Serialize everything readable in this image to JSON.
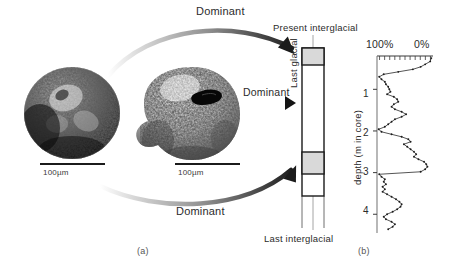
{
  "figure": {
    "panel_a_caption": "(a)",
    "panel_b_caption": "(b)"
  },
  "panel_a": {
    "specimens": [
      {
        "name": "dark-coiled-foraminifera",
        "scale_bar_label": "100µm"
      },
      {
        "name": "pale-lobed-foraminifera",
        "scale_bar_label": "100µm"
      }
    ],
    "arrows": [
      {
        "id": "arrow-top",
        "label": "Dominant"
      },
      {
        "id": "arrow-middle",
        "label": "Dominant"
      },
      {
        "id": "arrow-bottom",
        "label": "Dominant"
      }
    ],
    "core_column": {
      "top_band_label": "Present interglacial",
      "middle_label": "Last glacial",
      "bottom_band_label": "Last interglacial",
      "band_color": "#d9d9d9",
      "outline_color": "#1a1a1a"
    }
  },
  "panel_b": {
    "axis_top_left_label": "100%",
    "axis_top_right_label": "0%",
    "y_axis_label": "depth (m in core)",
    "y_ticks": [
      "1",
      "2",
      "3",
      "4"
    ]
  },
  "chart_data": {
    "type": "line",
    "title": "",
    "xlabel": "",
    "ylabel": "depth (m in core)",
    "xlim": [
      100,
      0
    ],
    "ylim": [
      0.2,
      4.45
    ],
    "x_tick_labels": [
      "100%",
      "0%"
    ],
    "y_tick_labels": [
      "1",
      "2",
      "3",
      "4"
    ],
    "grid": false,
    "legend": null,
    "x_axis_position": "top",
    "y_axis_direction": "down",
    "x_minor_tick_count": 11,
    "series": [
      {
        "name": "abundance of dominant species (%)",
        "points": [
          [
            3,
            0.25
          ],
          [
            5,
            0.33
          ],
          [
            14,
            0.4
          ],
          [
            22,
            0.46
          ],
          [
            36,
            0.52
          ],
          [
            62,
            0.58
          ],
          [
            88,
            0.64
          ],
          [
            96,
            0.7
          ],
          [
            92,
            0.76
          ],
          [
            86,
            0.82
          ],
          [
            84,
            0.88
          ],
          [
            80,
            0.94
          ],
          [
            78,
            1.0
          ],
          [
            76,
            1.06
          ],
          [
            82,
            1.12
          ],
          [
            70,
            1.18
          ],
          [
            64,
            1.24
          ],
          [
            62,
            1.3
          ],
          [
            70,
            1.36
          ],
          [
            74,
            1.42
          ],
          [
            68,
            1.48
          ],
          [
            56,
            1.54
          ],
          [
            48,
            1.6
          ],
          [
            56,
            1.66
          ],
          [
            68,
            1.72
          ],
          [
            74,
            1.78
          ],
          [
            80,
            1.84
          ],
          [
            86,
            1.9
          ],
          [
            97,
            1.96
          ],
          [
            92,
            2.02
          ],
          [
            74,
            2.08
          ],
          [
            56,
            2.14
          ],
          [
            44,
            2.2
          ],
          [
            40,
            2.26
          ],
          [
            52,
            2.32
          ],
          [
            46,
            2.38
          ],
          [
            40,
            2.44
          ],
          [
            34,
            2.5
          ],
          [
            30,
            2.56
          ],
          [
            34,
            2.62
          ],
          [
            26,
            2.68
          ],
          [
            16,
            2.74
          ],
          [
            12,
            2.8
          ],
          [
            10,
            2.86
          ],
          [
            14,
            2.92
          ],
          [
            22,
            2.98
          ],
          [
            96,
            3.04
          ],
          [
            92,
            3.1
          ],
          [
            86,
            3.16
          ],
          [
            88,
            3.22
          ],
          [
            84,
            3.28
          ],
          [
            90,
            3.34
          ],
          [
            86,
            3.4
          ],
          [
            90,
            3.46
          ],
          [
            82,
            3.52
          ],
          [
            74,
            3.58
          ],
          [
            66,
            3.64
          ],
          [
            60,
            3.7
          ],
          [
            56,
            3.76
          ],
          [
            58,
            3.82
          ],
          [
            64,
            3.88
          ],
          [
            72,
            3.94
          ],
          [
            82,
            4.0
          ],
          [
            88,
            4.06
          ],
          [
            84,
            4.12
          ],
          [
            74,
            4.18
          ],
          [
            68,
            4.24
          ],
          [
            72,
            4.3
          ],
          [
            80,
            4.36
          ]
        ]
      }
    ]
  }
}
